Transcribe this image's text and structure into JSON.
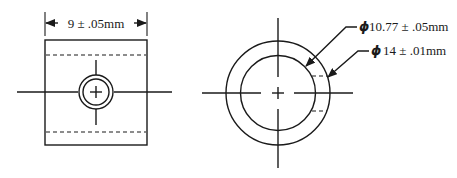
{
  "figure": {
    "type": "technical-drawing",
    "colors": {
      "stroke": "#1a1a1a",
      "background": "#ffffff"
    }
  },
  "side_view": {
    "width_dimension": {
      "value": "9",
      "tolerance": "± .05",
      "unit": "mm",
      "label": "9 ± .05mm"
    }
  },
  "end_view": {
    "inner_diameter": {
      "symbol": "ϕ",
      "value": "10.77",
      "tolerance": "± .05",
      "unit": "mm",
      "label": "10.77 ± .05mm"
    },
    "outer_diameter": {
      "symbol": "ϕ",
      "value": "14",
      "tolerance": "± .01",
      "unit": "mm",
      "label": "14 ± .01mm"
    }
  }
}
